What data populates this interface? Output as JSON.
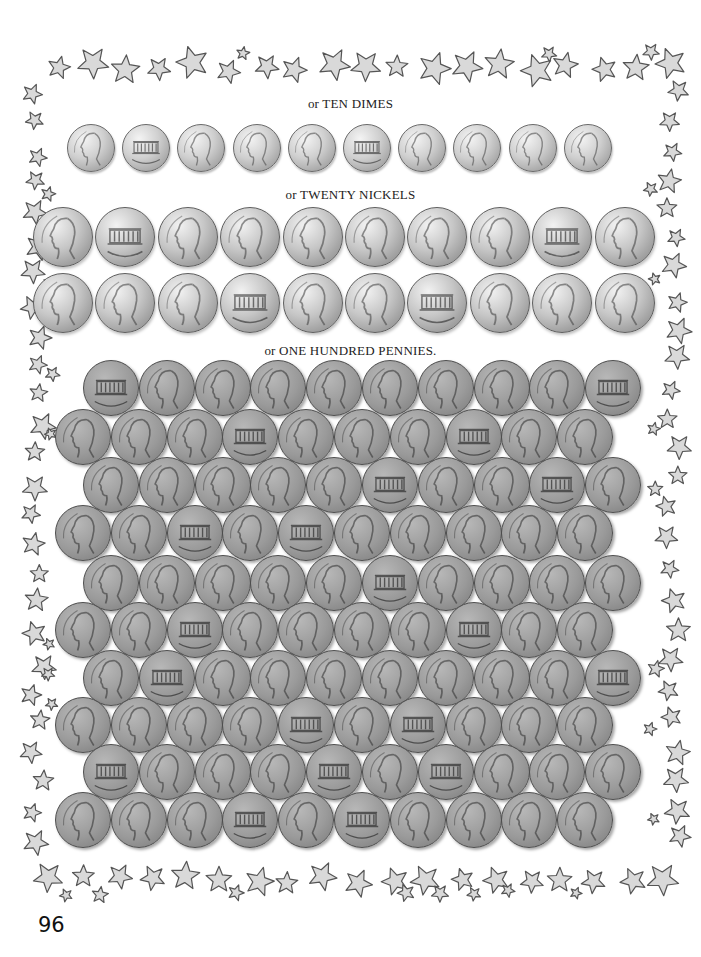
{
  "captions": {
    "dimes": "or TEN DIMES",
    "nickels": "or TWENTY NICKELS",
    "pennies": "or ONE HUNDRED PENNIES."
  },
  "page_number": "96",
  "colors": {
    "star_fill": "#d9d9d9",
    "star_stroke": "#555555",
    "penny": "#9a9a9a",
    "nickel": "#c6c6c6",
    "dime": "#cfcfcf"
  },
  "coins": {
    "dimes": {
      "count": 10,
      "faces": [
        "heads",
        "tails",
        "heads",
        "heads",
        "heads",
        "tails",
        "heads",
        "heads",
        "heads",
        "heads"
      ]
    },
    "nickels": {
      "count": 20,
      "rows": [
        [
          "heads",
          "tails",
          "heads",
          "heads",
          "heads",
          "heads",
          "heads",
          "heads",
          "tails",
          "heads"
        ],
        [
          "heads",
          "heads",
          "heads",
          "tails",
          "heads",
          "heads",
          "tails",
          "heads",
          "heads",
          "heads"
        ]
      ]
    },
    "pennies": {
      "count": 100,
      "tails_positions": [
        [
          0,
          0
        ],
        [
          0,
          9
        ],
        [
          1,
          3
        ],
        [
          1,
          7
        ],
        [
          2,
          5
        ],
        [
          2,
          8
        ],
        [
          3,
          2
        ],
        [
          3,
          4
        ],
        [
          4,
          5
        ],
        [
          5,
          2
        ],
        [
          5,
          7
        ],
        [
          6,
          1
        ],
        [
          6,
          9
        ],
        [
          7,
          4
        ],
        [
          7,
          6
        ],
        [
          8,
          0
        ],
        [
          8,
          4
        ],
        [
          8,
          6
        ],
        [
          9,
          3
        ],
        [
          9,
          5
        ]
      ]
    }
  },
  "decoration": {
    "border": "star-border-icon"
  }
}
